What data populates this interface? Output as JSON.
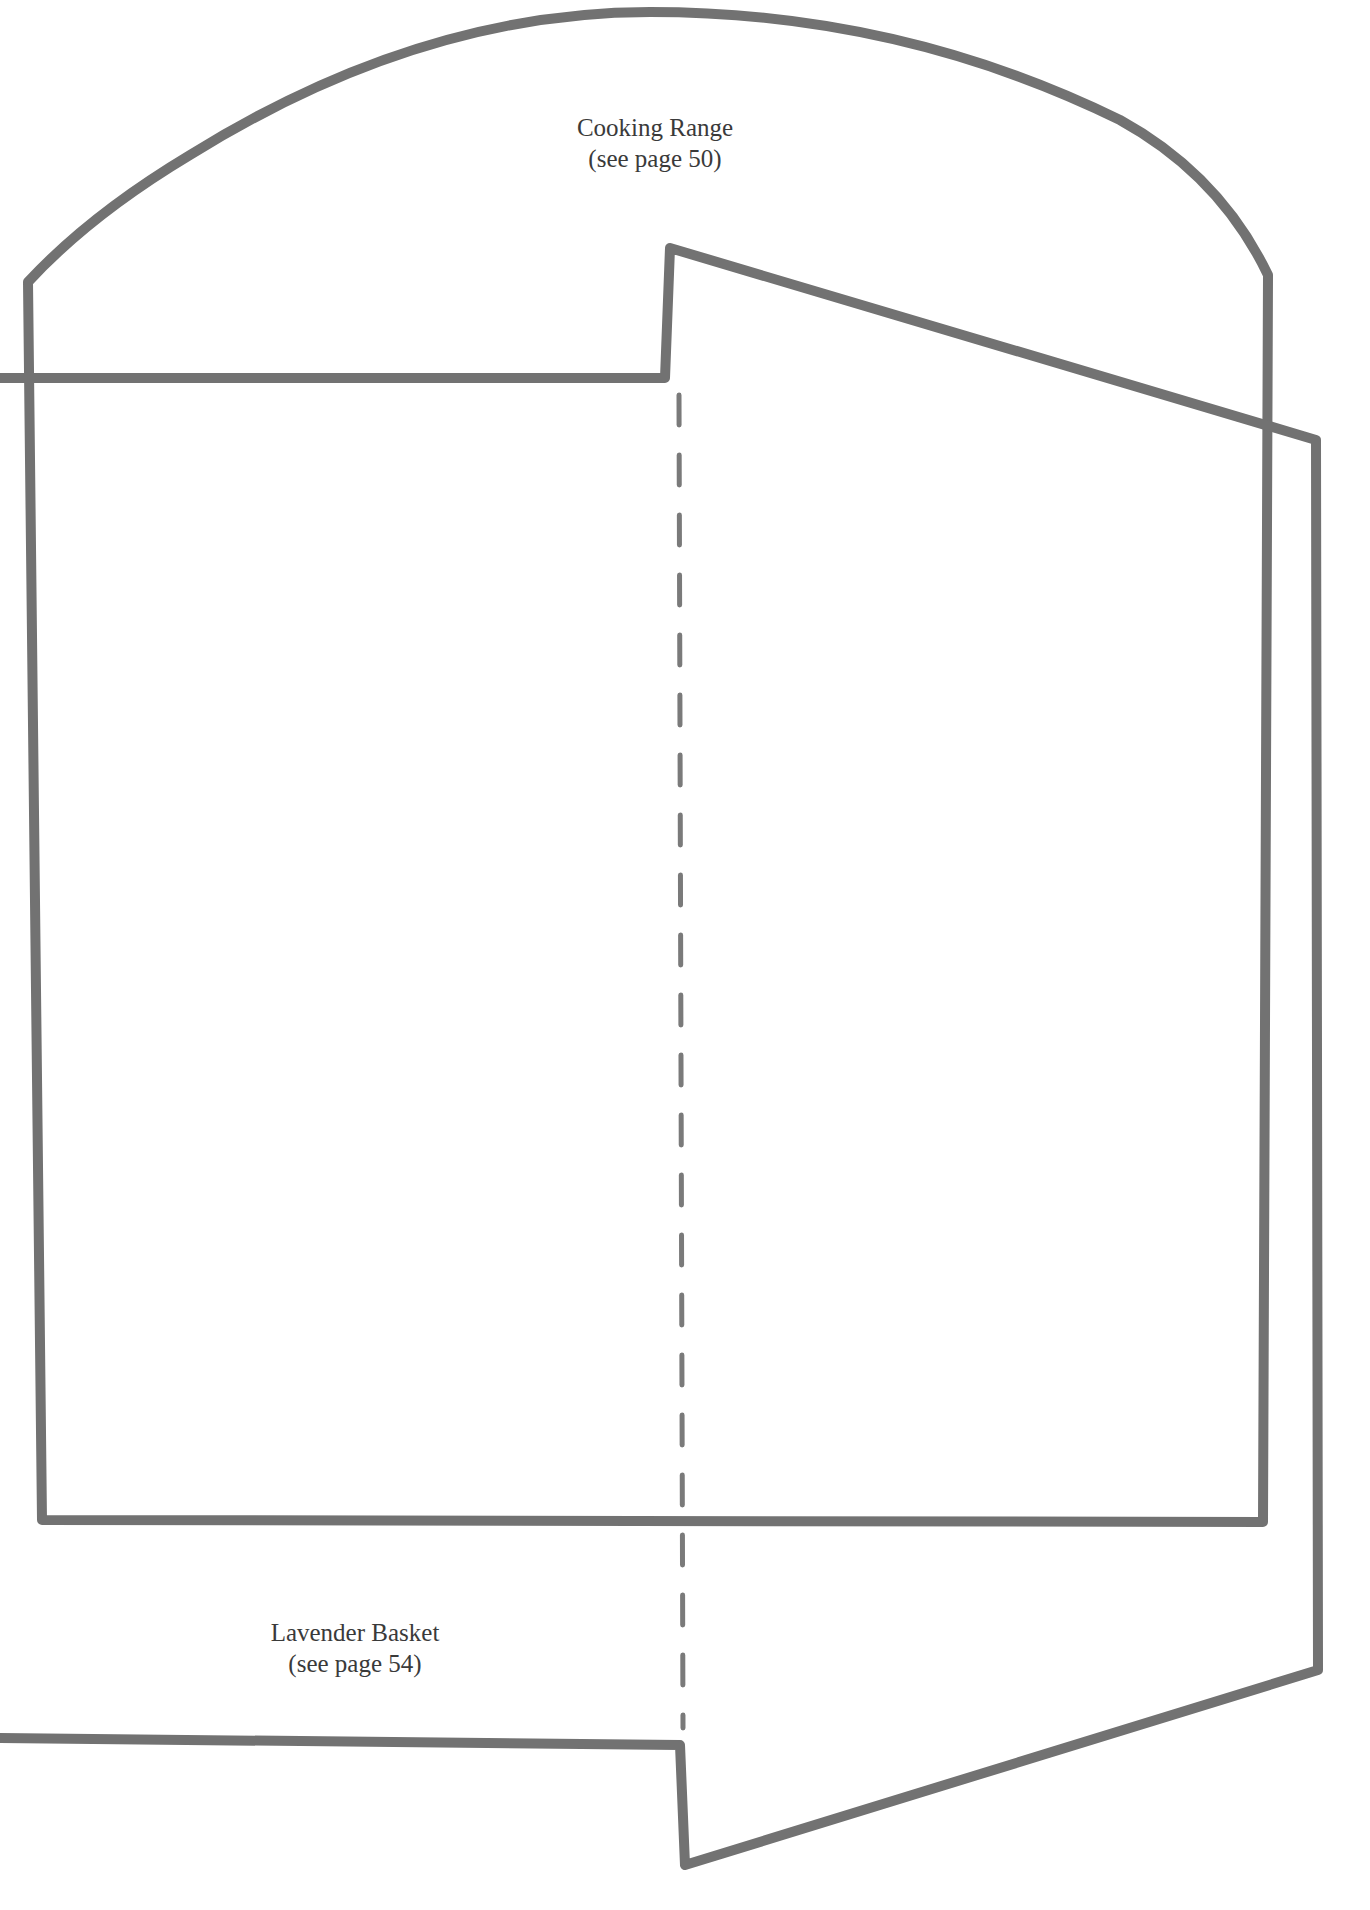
{
  "page": {
    "background": "#ffffff",
    "line_color": "#727272"
  },
  "templates": {
    "cooking_range": {
      "title": "Cooking Range",
      "reference": "(see page 50)"
    },
    "lavender_basket": {
      "title": "Lavender Basket",
      "reference": "(see page 54)"
    }
  },
  "annotations": {
    "fold_line": "dashed"
  }
}
